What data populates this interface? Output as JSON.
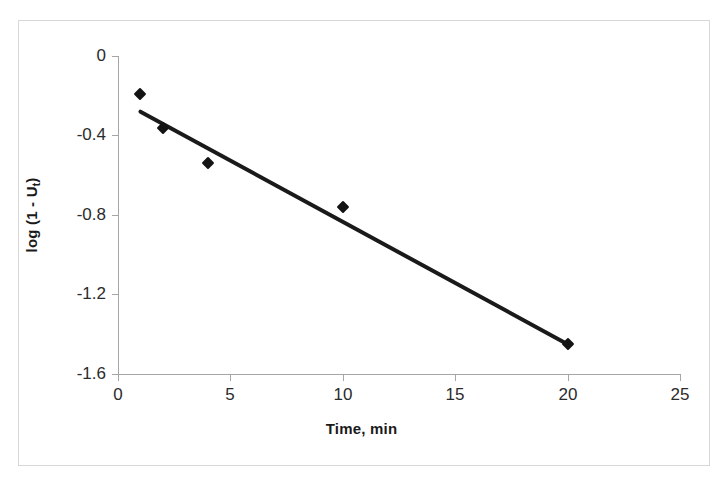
{
  "chart_data": {
    "type": "scatter",
    "title": "",
    "xlabel": "Time, min",
    "ylabel": "log (1 - Ut)",
    "ylabel_base": "log (1 - U",
    "ylabel_sub": "t",
    "ylabel_close": ")",
    "x": [
      1,
      2,
      4,
      10,
      20
    ],
    "values": [
      -0.19,
      -0.36,
      -0.54,
      -0.76,
      -1.45
    ],
    "series": [
      {
        "name": "log (1 - Ut)",
        "x": [
          1,
          2,
          4,
          10,
          20
        ],
        "values": [
          -0.19,
          -0.36,
          -0.54,
          -0.76,
          -1.45
        ]
      }
    ],
    "trendline": {
      "type": "linear",
      "x_start": 1.0,
      "y_start": -0.28,
      "x_end": 20.0,
      "y_end": -1.45
    },
    "xlim": [
      0,
      25
    ],
    "ylim": [
      -1.6,
      0
    ],
    "xticks": [
      0,
      5,
      10,
      15,
      20,
      25
    ],
    "xtick_labels": [
      "0",
      "5",
      "10",
      "15",
      "20",
      "25"
    ],
    "yticks": [
      0,
      -0.4,
      -0.8,
      -1.2,
      -1.6
    ],
    "ytick_labels": [
      "0",
      "-0.4",
      "-0.8",
      "-1.2",
      "-1.6"
    ],
    "grid": false,
    "legend": false,
    "marker_style": "diamond",
    "marker_color": "#141414",
    "line_color": "#1a1a1a",
    "axis_color": "#a6a6a6",
    "background_color": "#ffffff",
    "frame_color": "#d8d8d8"
  }
}
